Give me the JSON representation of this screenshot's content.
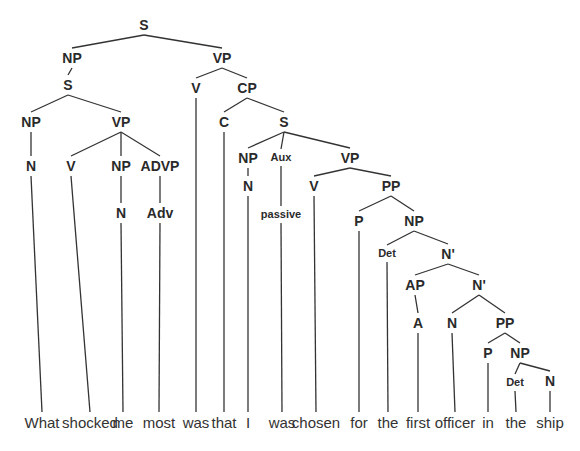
{
  "diagram": {
    "type": "syntax-tree",
    "sentence": "What shocked me most was that I was chosen for the first officer in the ship",
    "nodes": [
      {
        "id": "S0",
        "label": "S",
        "small": false
      },
      {
        "id": "NP0",
        "label": "NP",
        "small": false
      },
      {
        "id": "VP0",
        "label": "VP",
        "small": false
      },
      {
        "id": "S1",
        "label": "S",
        "small": false
      },
      {
        "id": "NP1",
        "label": "NP",
        "small": false
      },
      {
        "id": "VP1",
        "label": "VP",
        "small": false
      },
      {
        "id": "N1",
        "label": "N",
        "small": false
      },
      {
        "id": "V1",
        "label": "V",
        "small": false
      },
      {
        "id": "NP2",
        "label": "NP",
        "small": false
      },
      {
        "id": "ADVP",
        "label": "ADVP",
        "small": false
      },
      {
        "id": "N2",
        "label": "N",
        "small": false
      },
      {
        "id": "ADV",
        "label": "Adv",
        "small": false
      },
      {
        "id": "V0",
        "label": "V",
        "small": false
      },
      {
        "id": "CP",
        "label": "CP",
        "small": false
      },
      {
        "id": "C",
        "label": "C",
        "small": false
      },
      {
        "id": "S2",
        "label": "S",
        "small": false
      },
      {
        "id": "NP3",
        "label": "NP",
        "small": false
      },
      {
        "id": "AUX",
        "label": "Aux",
        "small": true
      },
      {
        "id": "VP2",
        "label": "VP",
        "small": false
      },
      {
        "id": "N3",
        "label": "N",
        "small": false
      },
      {
        "id": "PASS",
        "label": "passive",
        "small": true
      },
      {
        "id": "V2",
        "label": "V",
        "small": false
      },
      {
        "id": "PP1",
        "label": "PP",
        "small": false
      },
      {
        "id": "P1",
        "label": "P",
        "small": false
      },
      {
        "id": "NP4",
        "label": "NP",
        "small": false
      },
      {
        "id": "DET1",
        "label": "Det",
        "small": true
      },
      {
        "id": "NB1",
        "label": "N'",
        "small": false
      },
      {
        "id": "AP",
        "label": "AP",
        "small": false
      },
      {
        "id": "NB2",
        "label": "N'",
        "small": false
      },
      {
        "id": "A",
        "label": "A",
        "small": false
      },
      {
        "id": "N4",
        "label": "N",
        "small": false
      },
      {
        "id": "PP2",
        "label": "PP",
        "small": false
      },
      {
        "id": "P2",
        "label": "P",
        "small": false
      },
      {
        "id": "NP5",
        "label": "NP",
        "small": false
      },
      {
        "id": "DET2",
        "label": "Det",
        "small": true
      },
      {
        "id": "N5",
        "label": "N",
        "small": false
      }
    ],
    "edges": [
      [
        "S0",
        "NP0"
      ],
      [
        "S0",
        "VP0"
      ],
      [
        "NP0",
        "S1"
      ],
      [
        "S1",
        "NP1"
      ],
      [
        "S1",
        "VP1"
      ],
      [
        "NP1",
        "N1"
      ],
      [
        "VP1",
        "V1"
      ],
      [
        "VP1",
        "NP2"
      ],
      [
        "VP1",
        "ADVP"
      ],
      [
        "NP2",
        "N2"
      ],
      [
        "ADVP",
        "ADV"
      ],
      [
        "VP0",
        "V0"
      ],
      [
        "VP0",
        "CP"
      ],
      [
        "CP",
        "C"
      ],
      [
        "CP",
        "S2"
      ],
      [
        "S2",
        "NP3"
      ],
      [
        "S2",
        "AUX"
      ],
      [
        "S2",
        "VP2"
      ],
      [
        "NP3",
        "N3"
      ],
      [
        "AUX",
        "PASS"
      ],
      [
        "VP2",
        "V2"
      ],
      [
        "VP2",
        "PP1"
      ],
      [
        "PP1",
        "P1"
      ],
      [
        "PP1",
        "NP4"
      ],
      [
        "NP4",
        "DET1"
      ],
      [
        "NP4",
        "NB1"
      ],
      [
        "NB1",
        "AP"
      ],
      [
        "NB1",
        "NB2"
      ],
      [
        "AP",
        "A"
      ],
      [
        "NB2",
        "N4"
      ],
      [
        "NB2",
        "PP2"
      ],
      [
        "PP2",
        "P2"
      ],
      [
        "PP2",
        "NP5"
      ],
      [
        "NP5",
        "DET2"
      ],
      [
        "NP5",
        "N5"
      ]
    ],
    "words": [
      {
        "text": "What",
        "parent": "N1"
      },
      {
        "text": "shocked",
        "parent": "V1"
      },
      {
        "text": "me",
        "parent": "N2"
      },
      {
        "text": "most",
        "parent": "ADV"
      },
      {
        "text": "was",
        "parent": "V0"
      },
      {
        "text": "that",
        "parent": "C"
      },
      {
        "text": "I",
        "parent": "N3"
      },
      {
        "text": "was",
        "parent": "PASS"
      },
      {
        "text": "chosen",
        "parent": "V2"
      },
      {
        "text": "for",
        "parent": "P1"
      },
      {
        "text": "the",
        "parent": "DET1"
      },
      {
        "text": "first",
        "parent": "A"
      },
      {
        "text": "officer",
        "parent": "N4"
      },
      {
        "text": "in",
        "parent": "P2"
      },
      {
        "text": "the",
        "parent": "DET2"
      },
      {
        "text": "ship",
        "parent": "N5"
      }
    ]
  }
}
